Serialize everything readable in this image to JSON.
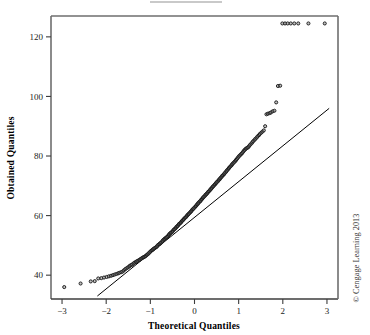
{
  "figure": {
    "credit": "© Cengage Learning 2013",
    "top_fragment": ""
  },
  "chart_data": {
    "type": "scatter",
    "title": "",
    "xlabel": "Theoretical Quantiles",
    "ylabel": "Obtained Quantiles",
    "xlim": [
      -3.25,
      3.25
    ],
    "ylim": [
      32,
      127
    ],
    "xticks": [
      -3,
      -2,
      -1,
      0,
      1,
      2,
      3
    ],
    "xticklabels": [
      "−3",
      "−2",
      "−1",
      "0",
      "1",
      "2",
      "3"
    ],
    "yticks": [
      40,
      60,
      80,
      100,
      120
    ],
    "yticklabels": [
      "40",
      "60",
      "80",
      "100",
      "120"
    ],
    "grid": false,
    "legend": null,
    "marker": {
      "shape": "open-circle",
      "size": 3.1,
      "edge_color": "#1a1a1a",
      "fill_color": "#8f8f8f"
    },
    "reference_line": {
      "label": "normal reference line",
      "color": "#000000",
      "width": 1,
      "x": [
        -2.2,
        3.05
      ],
      "y": [
        33.0,
        96.0
      ]
    },
    "series": [
      {
        "name": "Sample quantiles",
        "x": [
          -2.95,
          -2.58,
          -2.35,
          -2.26,
          -2.18,
          -2.11,
          -2.05,
          -1.99,
          -1.94,
          -1.89,
          -1.85,
          -1.81,
          -1.77,
          -1.73,
          -1.7,
          -1.66,
          -1.63,
          -1.6,
          -1.57,
          -1.54,
          -1.51,
          -1.48,
          -1.46,
          -1.43,
          -1.41,
          -1.38,
          -1.36,
          -1.33,
          -1.31,
          -1.29,
          -1.26,
          -1.24,
          -1.22,
          -1.2,
          -1.18,
          -1.16,
          -1.14,
          -1.12,
          -1.1,
          -1.08,
          -1.06,
          -1.04,
          -1.02,
          -1.0,
          -0.98,
          -0.96,
          -0.94,
          -0.93,
          -0.91,
          -0.89,
          -0.87,
          -0.85,
          -0.84,
          -0.82,
          -0.8,
          -0.78,
          -0.77,
          -0.75,
          -0.73,
          -0.72,
          -0.7,
          -0.68,
          -0.67,
          -0.65,
          -0.63,
          -0.62,
          -0.6,
          -0.58,
          -0.57,
          -0.55,
          -0.54,
          -0.52,
          -0.5,
          -0.49,
          -0.47,
          -0.46,
          -0.44,
          -0.42,
          -0.41,
          -0.39,
          -0.38,
          -0.36,
          -0.35,
          -0.33,
          -0.31,
          -0.3,
          -0.28,
          -0.27,
          -0.25,
          -0.24,
          -0.22,
          -0.2,
          -0.19,
          -0.17,
          -0.16,
          -0.14,
          -0.13,
          -0.11,
          -0.09,
          -0.08,
          -0.06,
          -0.05,
          -0.03,
          -0.02,
          0.0,
          0.02,
          0.03,
          0.05,
          0.06,
          0.08,
          0.09,
          0.11,
          0.13,
          0.14,
          0.16,
          0.17,
          0.19,
          0.2,
          0.22,
          0.24,
          0.25,
          0.27,
          0.28,
          0.3,
          0.31,
          0.33,
          0.35,
          0.36,
          0.38,
          0.39,
          0.41,
          0.42,
          0.44,
          0.46,
          0.47,
          0.49,
          0.5,
          0.52,
          0.54,
          0.55,
          0.57,
          0.58,
          0.6,
          0.62,
          0.63,
          0.65,
          0.67,
          0.68,
          0.7,
          0.72,
          0.73,
          0.75,
          0.77,
          0.78,
          0.8,
          0.82,
          0.84,
          0.85,
          0.87,
          0.89,
          0.91,
          0.93,
          0.94,
          0.96,
          0.98,
          1.0,
          1.02,
          1.04,
          1.06,
          1.08,
          1.1,
          1.12,
          1.14,
          1.16,
          1.18,
          1.2,
          1.22,
          1.24,
          1.26,
          1.29,
          1.31,
          1.33,
          1.36,
          1.38,
          1.41,
          1.43,
          1.46,
          1.48,
          1.51,
          1.54,
          1.57,
          1.6,
          1.63,
          1.66,
          1.7,
          1.73,
          1.77,
          1.81,
          1.85,
          1.89,
          1.94,
          1.99,
          2.05,
          2.11,
          2.18,
          2.26,
          2.35,
          2.58,
          2.95
        ],
        "y": [
          36.0,
          37.2,
          37.9,
          38.0,
          38.9,
          39.0,
          39.2,
          39.4,
          39.6,
          39.8,
          40.0,
          40.2,
          40.4,
          40.6,
          40.8,
          41.0,
          41.2,
          41.6,
          42.0,
          42.3,
          42.6,
          42.9,
          43.2,
          43.4,
          43.6,
          43.9,
          44.2,
          44.4,
          44.6,
          44.8,
          45.0,
          45.2,
          45.4,
          45.6,
          45.8,
          46.0,
          46.1,
          46.3,
          46.5,
          46.8,
          47.0,
          47.3,
          47.6,
          47.9,
          48.2,
          48.4,
          48.6,
          48.8,
          49.0,
          49.2,
          49.4,
          49.6,
          49.9,
          50.2,
          50.4,
          50.6,
          50.8,
          51.0,
          51.3,
          51.6,
          51.9,
          52.1,
          52.3,
          52.5,
          52.7,
          52.9,
          53.2,
          53.5,
          53.8,
          54.0,
          54.2,
          54.4,
          54.6,
          54.9,
          55.2,
          55.4,
          55.6,
          55.9,
          56.2,
          56.4,
          56.6,
          56.9,
          57.2,
          57.4,
          57.6,
          57.9,
          58.2,
          58.4,
          58.6,
          58.9,
          59.2,
          59.4,
          59.6,
          59.9,
          60.2,
          60.4,
          60.6,
          60.9,
          61.2,
          61.4,
          61.7,
          62.0,
          62.2,
          62.4,
          62.7,
          63.0,
          63.2,
          63.5,
          63.8,
          64.0,
          64.3,
          64.6,
          64.8,
          65.1,
          65.4,
          65.6,
          65.9,
          66.2,
          66.4,
          66.7,
          67.0,
          67.2,
          67.4,
          67.7,
          68.0,
          68.2,
          68.5,
          68.8,
          69.0,
          69.3,
          69.6,
          69.8,
          70.1,
          70.4,
          70.6,
          70.9,
          71.2,
          71.4,
          71.7,
          72.0,
          72.2,
          72.5,
          72.8,
          73.1,
          73.4,
          73.6,
          73.9,
          74.2,
          74.5,
          74.8,
          75.1,
          75.4,
          75.7,
          76.0,
          76.3,
          76.6,
          76.9,
          77.2,
          77.5,
          77.8,
          78.1,
          78.4,
          78.7,
          79.0,
          79.4,
          79.8,
          80.1,
          80.4,
          80.7,
          81.0,
          81.4,
          81.8,
          82.1,
          82.4,
          82.6,
          82.8,
          83.0,
          83.4,
          83.8,
          84.2,
          84.6,
          85.0,
          85.4,
          85.8,
          86.2,
          86.6,
          87.0,
          87.4,
          87.8,
          88.2,
          88.6,
          90.0,
          94.0,
          94.2,
          94.4,
          94.6,
          95.0,
          95.2,
          98.0,
          103.5,
          103.6,
          124.5,
          124.5,
          124.5,
          124.5,
          124.5,
          124.5,
          124.5,
          124.5
        ]
      }
    ]
  }
}
